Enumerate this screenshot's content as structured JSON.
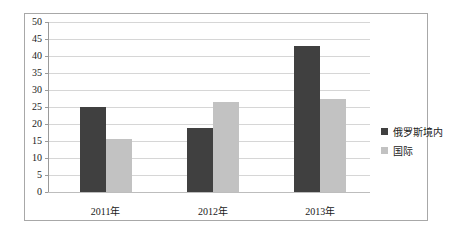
{
  "chart_data": {
    "type": "bar",
    "title": "",
    "subtitle": "",
    "xlabel": "",
    "ylabel": "",
    "categories": [
      "2011年",
      "2012年",
      "2013年"
    ],
    "series": [
      {
        "name": "俄罗斯境内",
        "color": "#404040",
        "values": [
          25,
          18.8,
          43
        ]
      },
      {
        "name": "国际",
        "color": "#c2c2c2",
        "values": [
          15.5,
          26.5,
          27.3
        ]
      }
    ],
    "ylim": [
      0,
      50
    ],
    "ytick_step": 5,
    "yticks": [
      0,
      5,
      10,
      15,
      20,
      25,
      30,
      35,
      40,
      45,
      50
    ],
    "ytick_labels": [
      "0",
      "5",
      "10",
      "15",
      "20",
      "25",
      "30",
      "35",
      "40",
      "45",
      "50"
    ],
    "grid": true,
    "grid_axis": "y",
    "legend_position": "right",
    "plot_background": "#ffffff",
    "grid_color": "#d6d6d6",
    "border_color": "#a8a8a8"
  }
}
